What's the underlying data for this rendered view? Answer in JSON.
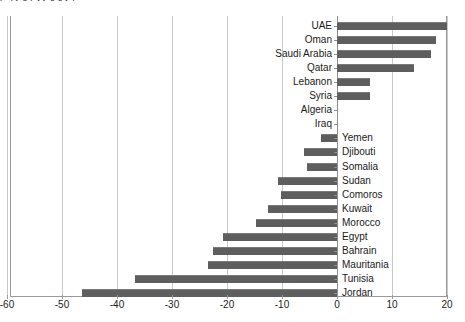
{
  "title_fragment": "p q y g  p j y g  g y p",
  "chart_data": {
    "type": "bar",
    "orientation": "horizontal",
    "title": "",
    "xlabel": "",
    "ylabel": "",
    "xlim": [
      -60,
      20
    ],
    "xticks": [
      -60,
      -50,
      -40,
      -30,
      -20,
      -10,
      0,
      10,
      20
    ],
    "xtick_labels": [
      "-60",
      "-50",
      "-40",
      "-30",
      "-20",
      "-10",
      "0",
      "10",
      "20"
    ],
    "grid": "vertical",
    "legend": "none",
    "bar_color": "#5e5e5e",
    "categories": [
      "UAE",
      "Oman",
      "Saudi Arabia",
      "Qatar",
      "Lebanon",
      "Syria",
      "Algeria",
      "Iraq",
      "Yemen",
      "Djibouti",
      "Somalia",
      "Sudan",
      "Comoros",
      "Kuwait",
      "Morocco",
      "Egypt",
      "Bahrain",
      "Mauritania",
      "Tunisia",
      "Jordan"
    ],
    "values": [
      20,
      18,
      17,
      14,
      6,
      6,
      0,
      0,
      -3,
      -6,
      -5.5,
      -10.7,
      -10.2,
      -12.5,
      -14.7,
      -20.7,
      -22.5,
      -23.5,
      -36.7,
      -46.4
    ],
    "label_side": [
      "left",
      "left",
      "left",
      "left",
      "left",
      "left",
      "left",
      "left",
      "right",
      "right",
      "right",
      "right",
      "right",
      "right",
      "right",
      "right",
      "right",
      "right",
      "right",
      "right"
    ]
  }
}
